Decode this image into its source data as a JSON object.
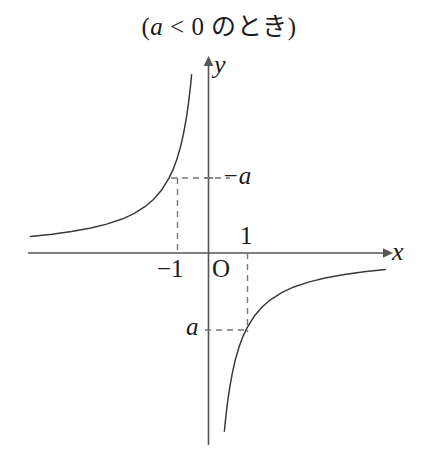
{
  "title": {
    "prefix": "(",
    "variable": "a",
    "relation": " < 0 ",
    "japanese": "のとき",
    "suffix": ")",
    "full": "(a < 0 のとき)"
  },
  "axes": {
    "x_label": "x",
    "y_label": "y",
    "origin_label": "O"
  },
  "ticks": {
    "x_negative_one": "−1",
    "x_one": "1",
    "y_negative_a": "−a",
    "y_a": "a"
  },
  "colors": {
    "ink": "#1c1c1c",
    "axis": "#555555",
    "curve": "#3a3a3a",
    "dashed": "#777777",
    "background": "#ffffff"
  },
  "chart_data": {
    "type": "line",
    "title": "(a < 0 のとき)",
    "xlabel": "x",
    "ylabel": "y",
    "function": "y = a/x",
    "condition": "a < 0",
    "grid": false,
    "legend": null,
    "xlim": [
      -4.5,
      4.5
    ],
    "ylim": [
      -4.5,
      4.5
    ],
    "origin_px": [
      208,
      253
    ],
    "unit_px": 39,
    "annotations": [
      {
        "text": "−1",
        "x": -1,
        "y": 0,
        "kind": "x-tick"
      },
      {
        "text": "1",
        "x": 1,
        "y": 0,
        "kind": "x-tick"
      },
      {
        "text": "−a",
        "x": 0,
        "y": 1.92,
        "kind": "y-tick"
      },
      {
        "text": "a",
        "x": 0,
        "y": -1.97,
        "kind": "y-tick"
      },
      {
        "text": "O",
        "x": 0,
        "y": 0,
        "kind": "origin"
      }
    ],
    "guides": [
      {
        "type": "dashed-h",
        "from": [
          -1,
          1.92
        ],
        "to": [
          0.55,
          1.92
        ]
      },
      {
        "type": "dashed-v",
        "from": [
          -1,
          0
        ],
        "to": [
          -1,
          1.92
        ]
      },
      {
        "type": "dashed-h",
        "from": [
          0,
          -1.97
        ],
        "to": [
          1,
          -1.97
        ]
      },
      {
        "type": "dashed-v",
        "from": [
          1,
          0
        ],
        "to": [
          1,
          -1.97
        ]
      }
    ],
    "series": [
      {
        "name": "branch-upper-left",
        "quadrant": 2,
        "x": [
          -4.55,
          -4.0,
          -3.5,
          -3.0,
          -2.6,
          -2.2,
          -1.9,
          -1.6,
          -1.4,
          -1.2,
          -1.0,
          -0.9,
          -0.8,
          -0.7,
          -0.62,
          -0.55,
          -0.5,
          -0.45,
          -0.42
        ],
        "y": [
          0.42,
          0.48,
          0.55,
          0.64,
          0.74,
          0.87,
          1.01,
          1.2,
          1.37,
          1.6,
          1.92,
          2.13,
          2.4,
          2.74,
          3.1,
          3.49,
          3.84,
          4.27,
          4.57
        ]
      },
      {
        "name": "branch-lower-right",
        "quadrant": 4,
        "x": [
          0.42,
          0.45,
          0.5,
          0.55,
          0.62,
          0.7,
          0.8,
          0.9,
          1.0,
          1.2,
          1.4,
          1.6,
          1.9,
          2.2,
          2.6,
          3.0,
          3.5,
          4.0,
          4.55
        ],
        "y": [
          -4.57,
          -4.27,
          -3.84,
          -3.49,
          -3.1,
          -2.74,
          -2.4,
          -2.13,
          -1.92,
          -1.6,
          -1.37,
          -1.2,
          -1.01,
          -0.87,
          -0.74,
          -0.64,
          -0.55,
          -0.48,
          -0.42
        ]
      }
    ]
  }
}
